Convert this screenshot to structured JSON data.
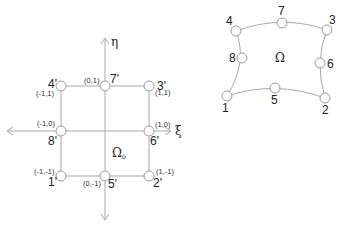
{
  "reference_element": {
    "domain_label": "Ω",
    "domain_subscript": "0",
    "axis_xi": "ξ",
    "axis_eta": "η",
    "nodes": [
      {
        "id": "1'",
        "coord": "(-1,-1)"
      },
      {
        "id": "2'",
        "coord": "(1,-1)"
      },
      {
        "id": "3'",
        "coord": "(1,1)"
      },
      {
        "id": "4'",
        "coord": "(-1,1)"
      },
      {
        "id": "5'",
        "coord": "(0,-1)"
      },
      {
        "id": "6'",
        "coord": "(1,0)"
      },
      {
        "id": "7'",
        "coord": "(0,1)"
      },
      {
        "id": "8'",
        "coord": "(-1,0)"
      }
    ]
  },
  "physical_element": {
    "domain_label": "Ω",
    "nodes": [
      {
        "id": "1"
      },
      {
        "id": "2"
      },
      {
        "id": "3"
      },
      {
        "id": "4"
      },
      {
        "id": "5"
      },
      {
        "id": "6"
      },
      {
        "id": "7"
      },
      {
        "id": "8"
      }
    ]
  }
}
